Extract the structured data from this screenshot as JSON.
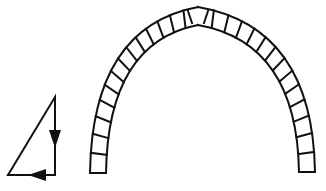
{
  "diagram": {
    "background": "#ffffff",
    "line_color": "#111111",
    "force_triangle": {
      "vertices": [
        [
          55,
          97
        ],
        [
          55,
          175
        ],
        [
          8,
          175
        ]
      ],
      "arrows": [
        {
          "direction": "down",
          "at": [
            55,
            140
          ]
        },
        {
          "direction": "left",
          "at": [
            36,
            175
          ]
        }
      ]
    },
    "pointed_arch": {
      "type": "gothic pointed arch of voussoirs",
      "apex_outer": [
        198,
        7
      ],
      "apex_inner": [
        198,
        25
      ],
      "left_springing": {
        "outer_x": 90,
        "inner_x": 106,
        "base_y": 173
      },
      "right_springing": {
        "outer_x": 315,
        "inner_x": 299,
        "base_y": 172
      },
      "voussoirs_per_side": 14
    }
  }
}
